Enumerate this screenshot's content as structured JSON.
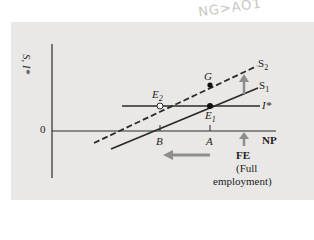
{
  "handwriting": "NG>AÕ1",
  "axes": {
    "y_label": "S, I*",
    "x_label": "NP",
    "origin_label": "0"
  },
  "curves": {
    "s1": {
      "label": "S",
      "sub": "1",
      "style": "solid"
    },
    "s2": {
      "label": "S",
      "sub": "2",
      "style": "dashed"
    },
    "i_star": {
      "label": "I*",
      "style": "solid"
    }
  },
  "points": {
    "e1": {
      "label": "E",
      "sub": "1"
    },
    "e2": {
      "label": "E",
      "sub": "2"
    },
    "g": {
      "label": "G"
    }
  },
  "ticks": {
    "b": "B",
    "a": "A"
  },
  "annotations": {
    "fe": "FE",
    "fe_desc_1": "(Full",
    "fe_desc_2": "employment)"
  },
  "colors": {
    "panel": "#e9e8e6",
    "line": "#2a2a2a",
    "arrow": "#8e8e8e"
  }
}
